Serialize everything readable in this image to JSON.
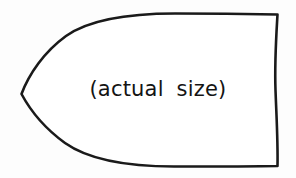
{
  "figure": {
    "name": "actual-size-template-outline",
    "caption": "(actual size)",
    "background_color": "#fdfdfd",
    "fill_color": "#ffffff",
    "stroke_color": "#1a1a1a",
    "stroke_width": 2.6,
    "text_color": "#141414",
    "shape": {
      "description": "bullet-shaped closed outline with a sharp point at the left, smooth convex curves along the top and bottom, and a slightly wavy vertical edge at the right",
      "path": "M 21.5 94 C 29 74 44 52 66 36 C 90 19 130 13.5 175 13.5 C 215 13.5 252 14 277.5 14.5 C 276 40 274.5 62 275.5 90 C 276.5 118 278 142 277.5 166 C 250 166.5 212 166.5 174 166.5 C 129 166.5 89 160 65 143 C 43 127 29 108 21.5 94 Z",
      "vertices": {
        "left_point": [
          21.5,
          94
        ],
        "top_right_corner": [
          277.5,
          14.5
        ],
        "bottom_right_corner": [
          277.5,
          166
        ]
      }
    }
  }
}
